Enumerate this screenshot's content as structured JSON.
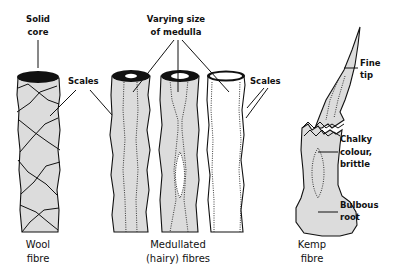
{
  "labels": {
    "solid_core_1": "Solid",
    "solid_core_2": "core",
    "medulla_1": "Varying size",
    "medulla_2": "of medulla",
    "scales_left": "Scales",
    "scales_right": "Scales",
    "fine_tip_1": "Fine",
    "fine_tip_2": "tip",
    "chalky_1": "Chalky",
    "chalky_2": "colour,",
    "chalky_3": "brittle",
    "bulbous_1": "Bulbous",
    "bulbous_2": "root"
  },
  "captions": {
    "wool_1": "Wool",
    "wool_2": "fibre",
    "medullated_1": "Medullated",
    "medullated_2": "(hairy)  fibres",
    "kemp_1": "Kemp",
    "kemp_2": "fibre"
  },
  "colors": {
    "fibre_fill": "#dcdcdc",
    "ink": "#111111",
    "background": "#ffffff"
  }
}
